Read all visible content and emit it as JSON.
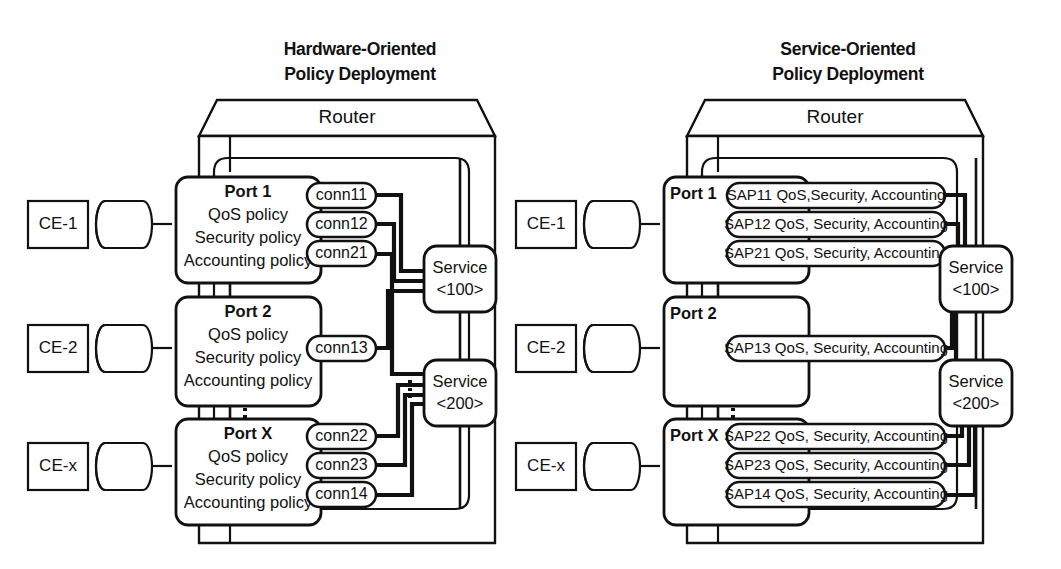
{
  "panels": [
    {
      "id": "hardware-oriented",
      "title_line1": "Hardware-Oriented",
      "title_line2": "Policy Deployment",
      "router_label": "Router",
      "style": "hardware",
      "ce_nodes": [
        {
          "label": "CE-1"
        },
        {
          "label": "CE-2"
        },
        {
          "label": "CE-x"
        }
      ],
      "ports": [
        {
          "name": "Port 1",
          "policies": [
            "QoS policy",
            "Security policy",
            "Accounting policy"
          ],
          "connections": [
            "conn11",
            "conn12",
            "conn21"
          ]
        },
        {
          "name": "Port 2",
          "policies": [
            "QoS policy",
            "Security policy",
            "Accounting policy"
          ],
          "connections": [
            "conn13"
          ]
        },
        {
          "name": "Port X",
          "policies": [
            "QoS policy",
            "Security policy",
            "Accounting policy"
          ],
          "connections": [
            "conn22",
            "conn23",
            "conn14"
          ]
        }
      ],
      "services": [
        {
          "line1": "Service",
          "line2": "<100>"
        },
        {
          "line1": "Service",
          "line2": "<200>"
        }
      ]
    },
    {
      "id": "service-oriented",
      "title_line1": "Service-Oriented",
      "title_line2": "Policy Deployment",
      "router_label": "Router",
      "style": "service",
      "ce_nodes": [
        {
          "label": "CE-1"
        },
        {
          "label": "CE-2"
        },
        {
          "label": "CE-x"
        }
      ],
      "ports": [
        {
          "name": "Port 1",
          "policies": [],
          "connections": [
            "SAP11 QoS,Security, Accounting",
            "SAP12 QoS, Security, Accounting",
            "SAP21 QoS, Security, Accounting"
          ]
        },
        {
          "name": "Port 2",
          "policies": [],
          "connections": [
            "SAP13 QoS, Security, Accounting"
          ]
        },
        {
          "name": "Port X",
          "policies": [],
          "connections": [
            "SAP22 QoS, Security, Accounting",
            "SAP23 QoS, Security, Accounting",
            "SAP14 QoS, Security, Accounting"
          ]
        }
      ],
      "services": [
        {
          "line1": "Service",
          "line2": "<100>"
        },
        {
          "line1": "Service",
          "line2": "<200>"
        }
      ]
    }
  ],
  "colors": {
    "stroke": "#111111",
    "background": "#ffffff",
    "thin": "#111111"
  }
}
